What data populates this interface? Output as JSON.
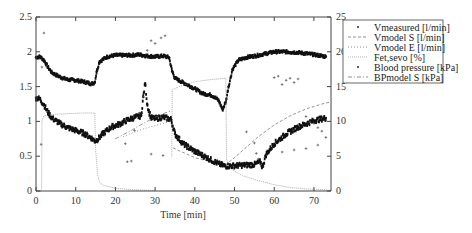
{
  "chart_data": {
    "type": "line",
    "title": "",
    "xlabel": "Time [min]",
    "ylabel": "",
    "y2label": "",
    "xlim": [
      0,
      74.3
    ],
    "ylim": [
      0,
      2.5
    ],
    "y2lim": [
      0,
      25
    ],
    "xticks": [
      0,
      10,
      20,
      30,
      40,
      50,
      60,
      70
    ],
    "yticks": [
      0,
      0.5,
      1,
      1.5,
      2,
      2.5
    ],
    "yticklabels": [
      "0",
      "0.5",
      "1",
      "1.5",
      "2",
      "2.5"
    ],
    "y2ticks": [
      0,
      5,
      10,
      15,
      20,
      25
    ],
    "grid": false,
    "legend_position": "outside-right-top",
    "series": [
      {
        "name": "Vmeasured [l/min]",
        "axis": "left",
        "style": "dense-markers",
        "x": [
          0,
          1,
          2,
          3,
          4,
          6,
          8,
          10,
          12,
          14,
          14.8,
          15.3,
          16,
          18,
          20,
          22,
          24,
          26,
          28,
          30,
          32,
          33.5,
          34.3,
          35,
          37,
          40,
          42,
          44,
          45,
          46,
          47,
          47.8,
          48.5,
          49.5,
          51,
          53,
          56,
          60,
          63,
          66,
          70,
          73
        ],
        "values": [
          1.92,
          1.93,
          1.88,
          1.78,
          1.7,
          1.64,
          1.6,
          1.59,
          1.57,
          1.54,
          1.56,
          1.72,
          1.86,
          1.93,
          1.95,
          1.95,
          1.95,
          1.96,
          1.94,
          1.93,
          1.94,
          1.92,
          1.72,
          1.62,
          1.56,
          1.47,
          1.4,
          1.38,
          1.35,
          1.3,
          1.17,
          1.28,
          1.5,
          1.75,
          1.88,
          1.92,
          1.95,
          2.0,
          2.0,
          1.99,
          1.96,
          1.93
        ]
      },
      {
        "name": "Vmodel S [l/min]",
        "axis": "left",
        "style": "dashed",
        "x": [
          34.5,
          36,
          38,
          40,
          42,
          44,
          46,
          47.8,
          50,
          53,
          56,
          60,
          64,
          68,
          72,
          74.3
        ],
        "values": [
          0.62,
          0.58,
          0.53,
          0.48,
          0.45,
          0.42,
          0.4,
          0.38,
          0.48,
          0.63,
          0.78,
          0.95,
          1.08,
          1.18,
          1.25,
          1.28
        ]
      },
      {
        "name": "Vmodel E [l/min]",
        "axis": "left",
        "style": "dotted",
        "x": [
          22,
          24,
          26,
          28,
          30,
          32,
          34,
          34.5
        ],
        "values": [
          0.78,
          0.83,
          0.87,
          0.91,
          0.94,
          0.97,
          1.0,
          1.01
        ]
      },
      {
        "name": "Fet,sevo [%]",
        "axis": "left",
        "style": "thin-solid",
        "x": [
          0,
          1.4,
          1.5,
          2,
          4,
          8,
          12,
          14.8,
          15,
          15.5,
          16,
          17,
          20,
          24,
          28,
          30
        ],
        "values": [
          0,
          0,
          1.0,
          1.08,
          1.1,
          1.11,
          1.12,
          1.12,
          0.6,
          0.25,
          0.12,
          0.08,
          0.04,
          0.02,
          0.01,
          0.01
        ]
      },
      {
        "name": "Fet,sevo [%] (2nd step)",
        "axis": "left",
        "style": "thin-solid",
        "hidden_in_legend": true,
        "x": [
          34.2,
          34.3,
          36,
          40,
          44,
          47.8,
          48,
          49,
          52,
          56,
          60,
          64,
          68,
          72,
          74.3
        ],
        "values": [
          0.5,
          1.45,
          1.5,
          1.57,
          1.6,
          1.62,
          0.45,
          0.32,
          0.22,
          0.15,
          0.09,
          0.05,
          0.03,
          0.02,
          0.01
        ]
      },
      {
        "name": "Blood pressure [kPa]",
        "axis": "right",
        "style": "dense-markers",
        "x": [
          0,
          1,
          2,
          3,
          4,
          6,
          8,
          10,
          12,
          14,
          14.8,
          15.5,
          17,
          19,
          21,
          23,
          25,
          26.5,
          27,
          27.5,
          28,
          28.5,
          29,
          30,
          32,
          34,
          35,
          37,
          40,
          43,
          46,
          47.5,
          49,
          52,
          55,
          56.5,
          57,
          58,
          60,
          63,
          66,
          70,
          73
        ],
        "values": [
          13.4,
          13.2,
          12.4,
          11.3,
          10.5,
          9.7,
          9.1,
          8.7,
          8.3,
          7.6,
          7.2,
          7.4,
          8.3,
          9.2,
          9.6,
          10.2,
          10.6,
          10.8,
          13.5,
          15.5,
          12.5,
          11.3,
          10.5,
          10.4,
          10.6,
          10.3,
          8.2,
          6.8,
          5.7,
          4.8,
          3.9,
          3.6,
          3.6,
          3.7,
          3.8,
          4.2,
          3.4,
          5.3,
          6.8,
          8.2,
          9.2,
          10.1,
          10.5
        ]
      },
      {
        "name": "Blood pressure [kPa] (sparse)",
        "axis": "right",
        "style": "sparse-markers",
        "hidden_in_legend": true,
        "x": [
          2,
          1.5,
          1.3,
          23,
          24,
          24.8,
          26,
          27,
          28,
          29,
          30,
          31.5,
          32.5,
          22.5,
          29,
          32,
          53,
          55,
          55.5,
          56,
          60,
          61,
          62,
          63,
          64,
          65,
          66,
          68,
          69,
          70,
          71,
          72,
          73,
          62,
          65,
          68,
          71
        ],
        "values": [
          22.7,
          17.8,
          6.7,
          4.2,
          4.3,
          8.7,
          11.2,
          13.5,
          20.2,
          21.6,
          21.2,
          22,
          22.3,
          6.8,
          5.3,
          5.1,
          8.5,
          6.9,
          5.4,
          4.6,
          16.3,
          16.5,
          15.3,
          15.9,
          16.2,
          15.6,
          16.1,
          10.7,
          9.9,
          9.7,
          9.1,
          8.6,
          7.7,
          5.6,
          5.9,
          6.1,
          6.6
        ]
      },
      {
        "name": "BPmodel S [kPa]",
        "axis": "right",
        "style": "dash-dot",
        "x": [
          20,
          22,
          24,
          26,
          28,
          30,
          32,
          34
        ],
        "values": [
          7.5,
          8.1,
          8.7,
          9.4,
          10.0,
          10.6,
          11.1,
          11.5
        ]
      }
    ]
  },
  "legend": {
    "items": [
      {
        "label": "Vmeasured [l/min]",
        "symbol": "marker"
      },
      {
        "label": "Vmodel S [l/min]",
        "symbol": "dashed"
      },
      {
        "label": "Vmodel E [l/min]",
        "symbol": "dotted"
      },
      {
        "label": "Fet,sevo [%]",
        "symbol": "thin-solid"
      },
      {
        "label": "Blood pressure [kPa]",
        "symbol": "marker"
      },
      {
        "label": "BPmodel S [kPa]",
        "symbol": "dash-dot"
      }
    ]
  },
  "colors": {
    "axis": "#444444",
    "data": "#111111",
    "model": "#666666",
    "text": "#333333"
  }
}
